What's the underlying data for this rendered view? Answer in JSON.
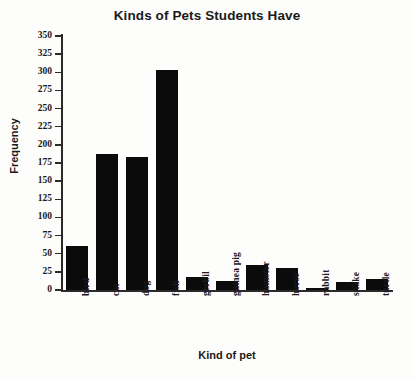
{
  "chart_data": {
    "type": "bar",
    "title": "Kinds of Pets Students Have",
    "xlabel": "Kind of pet",
    "ylabel": "Frequency",
    "categories": [
      "bird",
      "cat",
      "dog",
      "fish",
      "gerbil",
      "guinea pig",
      "hamster",
      "horse",
      "rabbit",
      "snake",
      "turtle"
    ],
    "values": [
      60,
      187,
      183,
      303,
      18,
      12,
      34,
      30,
      3,
      11,
      15
    ],
    "ylim": [
      0,
      350
    ],
    "ytick_step": 25,
    "yticks": [
      0,
      25,
      50,
      75,
      100,
      125,
      150,
      175,
      200,
      225,
      250,
      275,
      300,
      325,
      350
    ],
    "ytick_labels": [
      "0",
      "25",
      "50",
      "75",
      "100",
      "125",
      "150",
      "175",
      "200",
      "225",
      "250",
      "275",
      "300",
      "325",
      "350"
    ],
    "grid": false,
    "legend": false,
    "bar_color": "#0b0b0b",
    "axis_color": "#2b2b2b",
    "background": "#fdfdfc"
  }
}
